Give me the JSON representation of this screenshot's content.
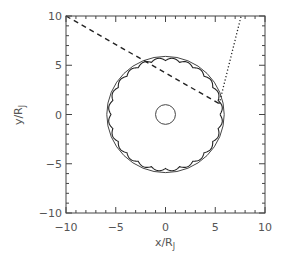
{
  "chart_data": {
    "type": "line",
    "title": "",
    "xlabel": "x/R_J",
    "ylabel": "y/R_J",
    "xlim": [
      -10,
      10
    ],
    "ylim": [
      -10,
      10
    ],
    "grid": false,
    "x_ticks": [
      -10,
      -5,
      0,
      5,
      10
    ],
    "y_ticks": [
      -10,
      -5,
      0,
      5,
      10
    ],
    "x_tick_labels": [
      "−10",
      "−5",
      "0",
      "5",
      "10"
    ],
    "y_tick_labels": [
      "−10",
      "−5",
      "0",
      "5",
      "10"
    ],
    "minor_tick_step": 1,
    "series": [
      {
        "name": "jupiter",
        "kind": "circle",
        "center": [
          0,
          0
        ],
        "radius": 1.0,
        "style": "solid"
      },
      {
        "name": "io-orbit",
        "kind": "circle",
        "center": [
          0,
          0
        ],
        "radius": 5.9,
        "style": "solid"
      },
      {
        "name": "scalloped-ring",
        "kind": "scalloped-circle",
        "center": [
          0,
          0
        ],
        "radius": 5.6,
        "scallops": 24,
        "amplitude": 0.3,
        "style": "solid"
      },
      {
        "name": "dashed-line",
        "kind": "line",
        "x": [
          -10,
          5.4
        ],
        "y": [
          10,
          1.1
        ],
        "style": "dashed"
      },
      {
        "name": "dotted-line",
        "kind": "line",
        "x": [
          5.4,
          7.6
        ],
        "y": [
          1.1,
          10
        ],
        "style": "dotted"
      }
    ]
  },
  "labels": {
    "xlabel_main": "x/R",
    "xlabel_sub": "J",
    "ylabel_main": "y/R",
    "ylabel_sub": "J"
  }
}
